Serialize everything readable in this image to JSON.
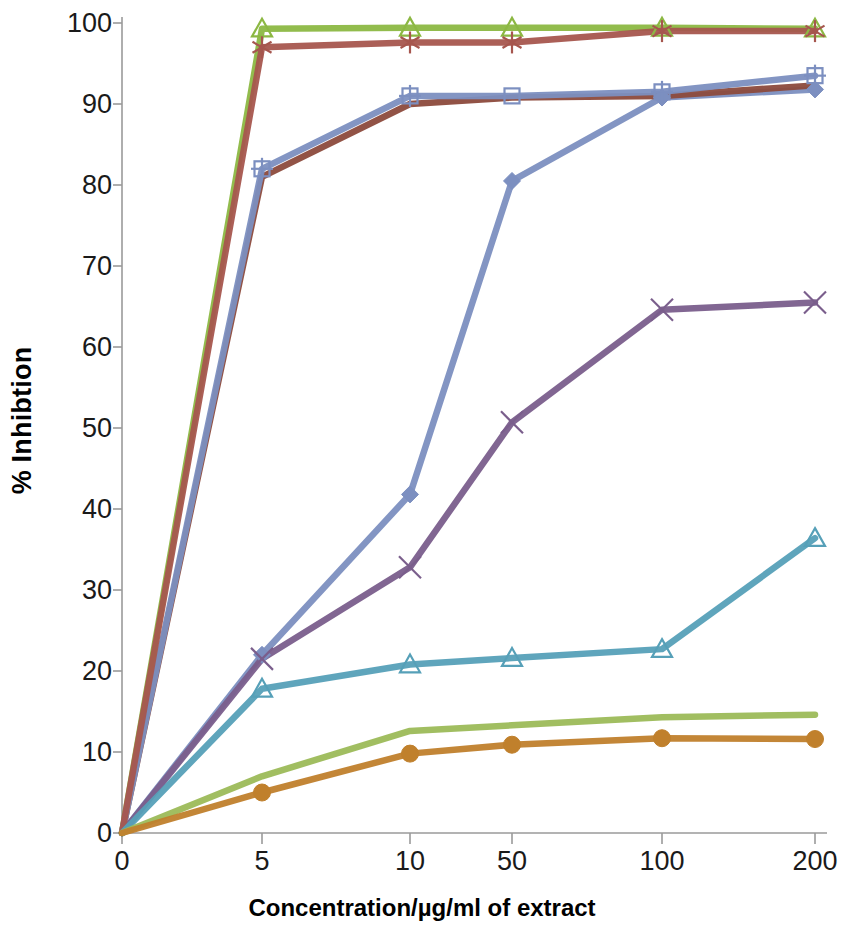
{
  "chart_data": {
    "type": "line",
    "title": "",
    "xlabel": "Concentration/µg/ml of extract",
    "ylabel": "% Inhibtion",
    "categories": [
      "0",
      "5",
      "10",
      "50",
      "100",
      "200"
    ],
    "xtick_labels": [
      "0",
      "5",
      "10",
      "50",
      "100",
      "200"
    ],
    "ytick_labels": [
      "0",
      "10",
      "20",
      "30",
      "40",
      "50",
      "60",
      "70",
      "80",
      "90",
      "100"
    ],
    "ylim": [
      0,
      100
    ],
    "ytick_step": 10,
    "grid": false,
    "legend": "none",
    "series": [
      {
        "name": "series-1",
        "marker": "diamond-filled",
        "color": "#7C8FC0",
        "values": [
          0,
          22.0,
          41.8,
          80.5,
          90.8,
          91.8
        ]
      },
      {
        "name": "series-2",
        "marker": "none",
        "color": "#8C4A3C",
        "values": [
          0,
          81.0,
          90.0,
          90.8,
          91.0,
          92.3
        ]
      },
      {
        "name": "series-3",
        "marker": "triangle-open",
        "color": "#8CB843",
        "values": [
          0,
          99.3,
          99.4,
          99.4,
          99.4,
          99.3
        ]
      },
      {
        "name": "series-4",
        "marker": "square-open",
        "color": "#7C8FC0",
        "values": [
          0,
          82.0,
          91.0,
          91.0,
          91.5,
          93.5
        ]
      },
      {
        "name": "series-5",
        "marker": "cross",
        "color": "#7A5E8C",
        "values": [
          0,
          21.5,
          32.8,
          50.7,
          64.6,
          65.5
        ]
      },
      {
        "name": "series-6",
        "marker": "asterisk",
        "color": "#A6564E",
        "values": [
          0,
          97.0,
          97.6,
          97.6,
          99.0,
          99.0
        ]
      },
      {
        "name": "series-7",
        "marker": "triangle-open",
        "color": "#56A0B8",
        "values": [
          0,
          17.8,
          20.8,
          21.6,
          22.7,
          36.4
        ]
      },
      {
        "name": "series-8",
        "marker": "none",
        "color": "#9CBB59",
        "values": [
          0,
          7.0,
          12.6,
          13.3,
          14.3,
          14.6
        ]
      },
      {
        "name": "series-9",
        "marker": "circle-filled",
        "color": "#C0802C",
        "values": [
          0,
          5.0,
          9.8,
          10.9,
          11.7,
          11.6
        ]
      }
    ],
    "axis_color": "#9a9a9a"
  }
}
